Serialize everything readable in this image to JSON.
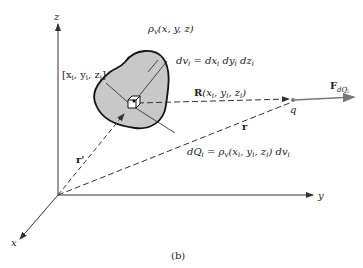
{
  "figure": {
    "caption": "(b)",
    "axes": {
      "x": "x",
      "y": "y",
      "z": "z"
    },
    "labels": {
      "density": "ρ",
      "density_sub": "v",
      "density_args": "(x, y, z)",
      "point": "[x",
      "point_rest": ", y",
      "point_rest2": ", z",
      "point_close": "]",
      "point_sub": "i",
      "dv": "dv",
      "dv_sub": "i",
      "dv_eq": " = dx",
      "dv_eq2": " dy",
      "dv_eq3": " dz",
      "R": "R",
      "R_args": "(x",
      "R_args2": ", y",
      "R_args3": ", z",
      "R_close": ")",
      "r": "r",
      "r_prime": "r'",
      "q": "q",
      "F": "F",
      "F_sub": "dQ",
      "F_sub2": "i",
      "dQ": "dQ",
      "dQ_sub": "i",
      "dQ_eq": " = ρ",
      "dQ_eq_sub": "v",
      "dQ_args": "(x",
      "dQ_args2": ", y",
      "dQ_args3": ", z",
      "dQ_close": ") dv",
      "dQ_close_sub": "i"
    },
    "colors": {
      "blob_fill": "#c8c8c8",
      "line": "#333333",
      "force_arrow": "#777777"
    }
  }
}
